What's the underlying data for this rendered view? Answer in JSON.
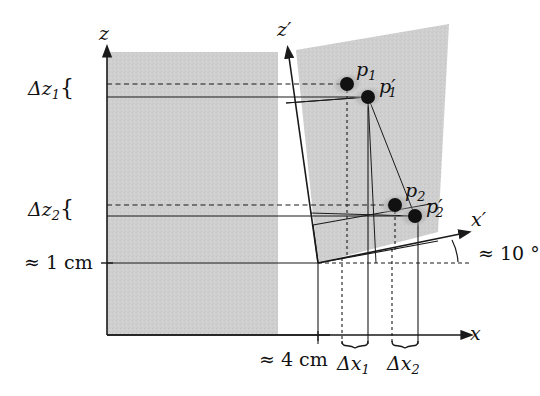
{
  "figure": {
    "background_color": "#ffffff",
    "shade_color": "#cdcdcd",
    "line_color": "#1a1a1a"
  },
  "axes": {
    "z_label": "z",
    "x_label": "x",
    "z_prime_label": "z′",
    "x_prime_label": "x′",
    "origin": {
      "x": 107,
      "y": 335
    },
    "origin_prime": {
      "x": 318,
      "y": 263
    }
  },
  "points": [
    {
      "name": "p1",
      "label": "p",
      "sub": "1",
      "prime": "",
      "x": 347,
      "y": 84,
      "label_x": 356,
      "label_y": 64
    },
    {
      "name": "p1p",
      "label": "p",
      "sub": "1",
      "prime": "′",
      "x": 368,
      "y": 97,
      "label_x": 379,
      "label_y": 80
    },
    {
      "name": "p2",
      "label": "p",
      "sub": "2",
      "prime": "",
      "x": 395,
      "y": 205,
      "label_x": 405,
      "label_y": 185
    },
    {
      "name": "p2p",
      "label": "p",
      "sub": "2",
      "prime": "′",
      "x": 415,
      "y": 216,
      "label_x": 426,
      "label_y": 200
    }
  ],
  "measurements": {
    "delta_z1": {
      "text": "Δz",
      "sub": "1",
      "brace": "{",
      "x": 28,
      "y": 78
    },
    "delta_z2": {
      "text": "Δz",
      "sub": "2",
      "brace": "{",
      "x": 28,
      "y": 200
    },
    "delta_x1": {
      "text": "Δx",
      "sub": "1",
      "x": 336,
      "y": 355
    },
    "delta_x2": {
      "text": "Δx",
      "sub": "2",
      "x": 386,
      "y": 355
    },
    "height_1cm": {
      "text": "≈ 1 cm",
      "x": 23,
      "y": 252
    },
    "width_4cm": {
      "text": "≈ 4 cm",
      "x": 262,
      "y": 355
    },
    "angle_10deg": {
      "text": "≈ 10 °",
      "x": 480,
      "y": 243
    }
  },
  "values": {
    "tilt_angle_deg": 10,
    "slab_height_cm": 1,
    "slab_width_cm": 4
  }
}
